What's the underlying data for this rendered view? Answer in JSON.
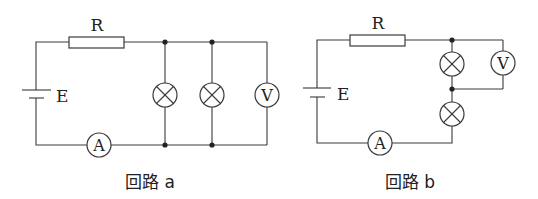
{
  "circuits": [
    {
      "id": "a",
      "caption": "回路 a",
      "labels": {
        "resistor": "R",
        "battery": "E",
        "ammeter": "A",
        "voltmeter": "V"
      },
      "topology": "R and A in series with E; two lamps and voltmeter V all in parallel"
    },
    {
      "id": "b",
      "caption": "回路 b",
      "labels": {
        "resistor": "R",
        "battery": "E",
        "ammeter": "A",
        "voltmeter": "V"
      },
      "topology": "R, two lamps in series and A in series with E; voltmeter V across the upper lamp"
    }
  ],
  "colors": {
    "line": "#3a3a3a",
    "background": "#ffffff"
  }
}
